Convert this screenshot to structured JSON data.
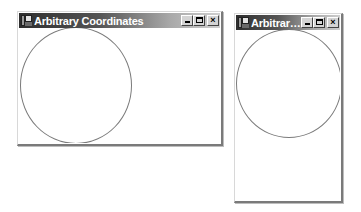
{
  "windows": [
    {
      "id": "window-wide",
      "title": "Arbitrary Coordinates",
      "controls": {
        "minimize": "_",
        "maximize": "□",
        "close": "×"
      },
      "icon": "app-window-icon",
      "drawing": {
        "shape": "circle",
        "stroke_color": "#7b7b7b"
      }
    },
    {
      "id": "window-tall",
      "title": "Arbitrary...",
      "controls": {
        "minimize": "_",
        "maximize": "□",
        "close": "×"
      },
      "icon": "app-window-icon",
      "drawing": {
        "shape": "circle",
        "stroke_color": "#7b7b7b"
      }
    }
  ],
  "colors": {
    "titlebar_dark": "#2e2e2e",
    "titlebar_light": "#cfcfcf",
    "client_background": "#ffffff"
  }
}
